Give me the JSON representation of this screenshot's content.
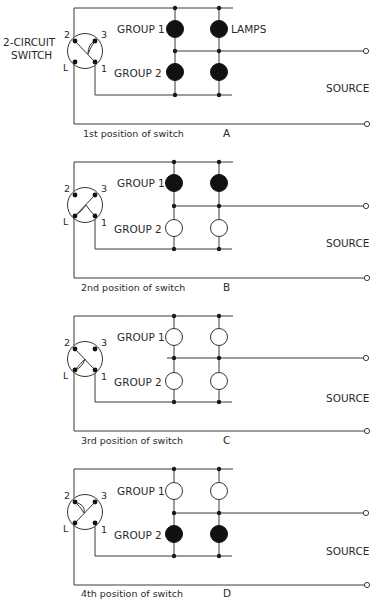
{
  "diagram": {
    "title_label_line1": "2-CIRCUIT",
    "title_label_line2": "SWITCH",
    "lamps_label": "LAMPS",
    "source_label": "SOURCE",
    "group1_label": "GROUP 1",
    "group2_label": "GROUP 2",
    "contact_labels": {
      "c2": "2",
      "c3": "3",
      "cL": "L",
      "c1": "1"
    },
    "colors": {
      "wire": "#3a3a3a",
      "lamp_on": "#111111",
      "lamp_off": "#ffffff"
    }
  },
  "panels": [
    {
      "letter": "A",
      "caption": "1st position of switch",
      "group1_state": "on",
      "group2_state": "on",
      "switch_link": "2-1 diagonal with branch to 3",
      "offset_y": 0
    },
    {
      "letter": "B",
      "caption": "2nd position of switch",
      "group1_state": "on",
      "group2_state": "off",
      "switch_link": "L-3 diagonal with branch to 1",
      "offset_y": 154
    },
    {
      "letter": "C",
      "caption": "3rd position of switch",
      "group1_state": "off",
      "group2_state": "off",
      "switch_link": "2-1 diagonal with branch to L",
      "offset_y": 308
    },
    {
      "letter": "D",
      "caption": "4th position of switch",
      "group1_state": "off",
      "group2_state": "on",
      "switch_link": "L-3 diagonal with branch to 2",
      "offset_y": 461
    }
  ]
}
